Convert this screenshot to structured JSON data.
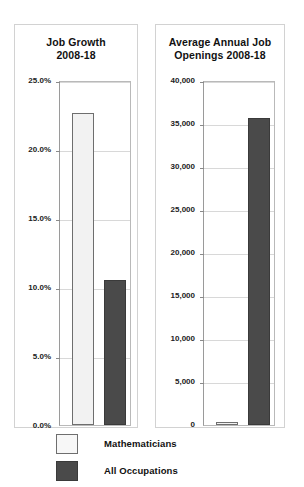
{
  "chart_data": [
    {
      "type": "bar",
      "title": "Job Growth 2008-18",
      "title_lines": [
        "Job Growth",
        "2008-18"
      ],
      "categories": [
        "Mathematicians",
        "All Occupations"
      ],
      "values": [
        22.6,
        10.5
      ],
      "unit": "percent",
      "xlabel": "",
      "ylabel": "",
      "ylim": [
        0,
        25
      ],
      "ytick_values": [
        25.0,
        20.0,
        15.0,
        10.0,
        5.0,
        0.0
      ],
      "ytick_labels": [
        "25.0%",
        "20.0%",
        "15.0%",
        "10.0%",
        "5.0%",
        "0.0%"
      ],
      "grid": true,
      "legend_position": "below-figure"
    },
    {
      "type": "bar",
      "title": "Average Annual Job Openings 2008-18",
      "title_lines": [
        "Average Annual Job",
        "Openings 2008-18"
      ],
      "categories": [
        "Mathematicians",
        "All Occupations"
      ],
      "values": [
        200,
        35600
      ],
      "unit": "openings",
      "xlabel": "",
      "ylabel": "",
      "ylim": [
        0,
        40000
      ],
      "ytick_values": [
        40000,
        35000,
        30000,
        25000,
        20000,
        15000,
        10000,
        5000,
        0
      ],
      "ytick_labels": [
        "40,000",
        "35,000",
        "30,000",
        "25,000",
        "20,000",
        "15,000",
        "10,000",
        "5,000",
        "0"
      ],
      "grid": true,
      "legend_position": "below-figure"
    }
  ],
  "legend": {
    "items": [
      {
        "label": "Mathematicians",
        "swatch": "light",
        "color": "#f7f7f7"
      },
      {
        "label": "All Occupations",
        "swatch": "dark",
        "color": "#4a4a4a"
      }
    ]
  },
  "colors": {
    "series_light": "#f2f2f2",
    "series_dark": "#4a4a4a",
    "panel_border": "#d2d2d2",
    "axis": "#9a9a9a",
    "gridline": "#d8d8d8",
    "text": "#111111",
    "background": "#ffffff"
  }
}
